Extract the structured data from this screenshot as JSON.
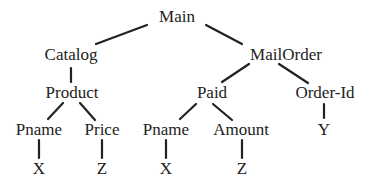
{
  "diagram": {
    "type": "tree",
    "colors": {
      "text": "#222222",
      "edge": "#222222",
      "background": "#ffffff"
    },
    "nodes": [
      {
        "id": "main",
        "label": "Main",
        "x": 177,
        "y": 22
      },
      {
        "id": "catalog",
        "label": "Catalog",
        "x": 71,
        "y": 60
      },
      {
        "id": "mailorder",
        "label": "MailOrder",
        "x": 286,
        "y": 60
      },
      {
        "id": "product",
        "label": "Product",
        "x": 72,
        "y": 98
      },
      {
        "id": "paid",
        "label": "Paid",
        "x": 212,
        "y": 98
      },
      {
        "id": "orderid",
        "label": "Order-Id",
        "x": 325,
        "y": 98
      },
      {
        "id": "pname1",
        "label": "Pname",
        "x": 39,
        "y": 135
      },
      {
        "id": "price",
        "label": "Price",
        "x": 102,
        "y": 135
      },
      {
        "id": "pname2",
        "label": "Pname",
        "x": 166,
        "y": 135
      },
      {
        "id": "amount",
        "label": "Amount",
        "x": 241,
        "y": 135
      },
      {
        "id": "y",
        "label": "Y",
        "x": 324,
        "y": 135
      },
      {
        "id": "x1",
        "label": "X",
        "x": 39,
        "y": 174
      },
      {
        "id": "z1",
        "label": "Z",
        "x": 102,
        "y": 174
      },
      {
        "id": "x2",
        "label": "X",
        "x": 166,
        "y": 174
      },
      {
        "id": "z2",
        "label": "Z",
        "x": 242,
        "y": 174
      }
    ],
    "edges": [
      {
        "from": "main",
        "to": "catalog",
        "x1": 147,
        "y1": 25,
        "x2": 96,
        "y2": 44
      },
      {
        "from": "main",
        "to": "mailorder",
        "x1": 206,
        "y1": 25,
        "x2": 242,
        "y2": 44
      },
      {
        "from": "catalog",
        "to": "product",
        "x1": 71,
        "y1": 68,
        "x2": 71,
        "y2": 82
      },
      {
        "from": "mailorder",
        "to": "paid",
        "x1": 249,
        "y1": 64,
        "x2": 222,
        "y2": 82
      },
      {
        "from": "mailorder",
        "to": "orderid",
        "x1": 279,
        "y1": 64,
        "x2": 308,
        "y2": 83
      },
      {
        "from": "product",
        "to": "pname1",
        "x1": 63,
        "y1": 103,
        "x2": 48,
        "y2": 119
      },
      {
        "from": "product",
        "to": "price",
        "x1": 80,
        "y1": 103,
        "x2": 95,
        "y2": 120
      },
      {
        "from": "paid",
        "to": "pname2",
        "x1": 196,
        "y1": 104,
        "x2": 180,
        "y2": 119
      },
      {
        "from": "paid",
        "to": "amount",
        "x1": 213,
        "y1": 104,
        "x2": 232,
        "y2": 120
      },
      {
        "from": "orderid",
        "to": "y",
        "x1": 324,
        "y1": 104,
        "x2": 324,
        "y2": 118
      },
      {
        "from": "pname1",
        "to": "x1",
        "x1": 39,
        "y1": 140,
        "x2": 39,
        "y2": 158
      },
      {
        "from": "price",
        "to": "z1",
        "x1": 102,
        "y1": 140,
        "x2": 102,
        "y2": 158
      },
      {
        "from": "pname2",
        "to": "x2",
        "x1": 166,
        "y1": 140,
        "x2": 166,
        "y2": 158
      },
      {
        "from": "amount",
        "to": "z2",
        "x1": 242,
        "y1": 140,
        "x2": 242,
        "y2": 158
      }
    ]
  }
}
